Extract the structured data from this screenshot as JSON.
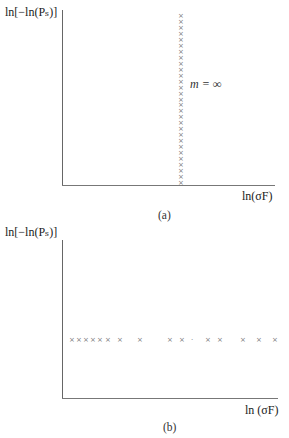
{
  "chart_data": [
    {
      "type": "scatter",
      "panel": "(a)",
      "ylabel": "ln[−ln(Pₛ)]",
      "xlabel": "ln(σF)",
      "annotation": "m = ∞",
      "grid": false,
      "marker": "×",
      "description": "Points form a vertical column at a single x value",
      "points_count": 29,
      "x_position_fraction": 0.56
    },
    {
      "type": "scatter",
      "panel": "(b)",
      "ylabel": "ln[−ln(Pₛ)]",
      "xlabel": "ln (σF)",
      "grid": false,
      "marker": "×",
      "description": "Points form a horizontal row at a single y value",
      "points_count": 14,
      "y_position_fraction": 0.5
    }
  ],
  "panel_a": {
    "ylabel": "ln[−ln(Pₛ)]",
    "xlabel": "ln(σF)",
    "annotation": "m = ∞",
    "caption": "(a)"
  },
  "panel_b": {
    "ylabel": "ln[−ln(Pₛ)]",
    "xlabel": "ln (σF)",
    "caption": "(b)"
  }
}
